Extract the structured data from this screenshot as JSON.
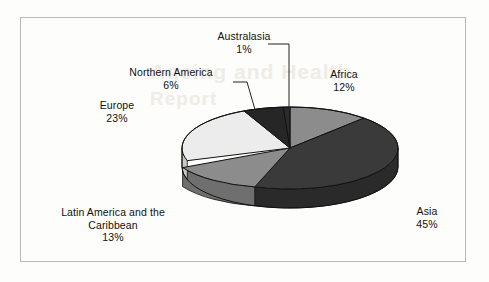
{
  "figure": {
    "frame_border_color": "#b9b9b9",
    "background_color": "#fdfdfb",
    "faint_background_text_1": "Ageing and Health",
    "faint_background_text_2": "Report"
  },
  "chart_data": {
    "type": "pie",
    "title": "",
    "subtitle": "",
    "xlabel": "",
    "ylabel": "",
    "legend_position": "none",
    "grid": false,
    "three_d": true,
    "start_angle_deg": 0,
    "direction": "clockwise",
    "units": "percent",
    "categories": [
      "Africa",
      "Asia",
      "Latin America and the Caribbean",
      "Europe",
      "Northern America",
      "Australasia"
    ],
    "values": [
      12,
      45,
      13,
      23,
      6,
      1
    ],
    "labels": [
      "Africa\n12%",
      "Asia\n45%",
      "Latin America and the Caribbean\n13%",
      "Europe\n23%",
      "Northern America\n6%",
      "Australasia\n1%"
    ],
    "colors": [
      "#8c8c8c",
      "#3a3a3a",
      "#8c8c8c",
      "#ececec",
      "#262626",
      "#2b2b2b"
    ],
    "slices": [
      {
        "name": "Africa",
        "percent_label": "12%",
        "value": 12,
        "color": "#8c8c8c",
        "side_color": "#6f6f6f"
      },
      {
        "name": "Asia",
        "percent_label": "45%",
        "value": 45,
        "color": "#3a3a3a",
        "side_color": "#2a2a2a"
      },
      {
        "name": "Latin America and the Caribbean",
        "percent_label": "13%",
        "value": 13,
        "color": "#8c8c8c",
        "side_color": "#6f6f6f"
      },
      {
        "name": "Europe",
        "percent_label": "23%",
        "value": 23,
        "color": "#ececec",
        "side_color": "#c9c9c9"
      },
      {
        "name": "Northern America",
        "percent_label": "6%",
        "value": 6,
        "color": "#262626",
        "side_color": "#1c1c1c"
      },
      {
        "name": "Australasia",
        "percent_label": "1%",
        "value": 1,
        "color": "#2b2b2b",
        "side_color": "#202020"
      }
    ]
  },
  "labels": {
    "australasia": {
      "name": "Australasia",
      "percent": "1%"
    },
    "northern_america": {
      "name": "Northern America",
      "percent": "6%"
    },
    "europe": {
      "name": "Europe",
      "percent": "23%"
    },
    "latin_america": {
      "name_line1": "Latin America and the",
      "name_line2": "Caribbean",
      "percent": "13%"
    },
    "africa": {
      "name": "Africa",
      "percent": "12%"
    },
    "asia": {
      "name": "Asia",
      "percent": "45%"
    }
  }
}
